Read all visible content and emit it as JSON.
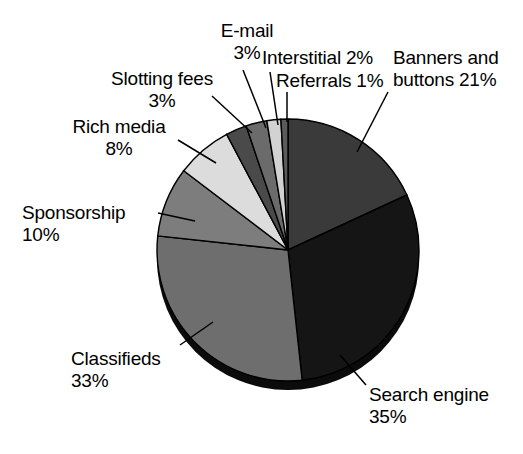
{
  "chart_data": {
    "type": "pie",
    "title": "",
    "subtitle": "",
    "xlabel": "",
    "ylabel": "",
    "legend_position": "callout-labels",
    "grid": false,
    "style": "3d-pie-grayscale",
    "value_unit": "%",
    "categories": [
      "Banners and buttons",
      "Search engine",
      "Classifieds",
      "Sponsorship",
      "Rich media",
      "Slotting fees",
      "E-mail",
      "Interstitial",
      "Referrals"
    ],
    "values": [
      21,
      35,
      33,
      10,
      8,
      3,
      3,
      2,
      1
    ],
    "colors": [
      "#3a3a3a",
      "#151515",
      "#6e6e6e",
      "#7d7d7d",
      "#dcdcdc",
      "#4a4a4a",
      "#6b6b6b",
      "#d2d2d2",
      "#5a5a5a"
    ],
    "slices": [
      {
        "label": "Banners and buttons",
        "value": 21,
        "text": "Banners and\nbuttons 21%",
        "color": "#3a3a3a"
      },
      {
        "label": "Search engine",
        "value": 35,
        "text": "Search engine\n35%",
        "color": "#151515"
      },
      {
        "label": "Classifieds",
        "value": 33,
        "text": "Classifieds\n33%",
        "color": "#6e6e6e"
      },
      {
        "label": "Sponsorship",
        "value": 10,
        "text": "Sponsorship\n10%",
        "color": "#7d7d7d"
      },
      {
        "label": "Rich media",
        "value": 8,
        "text": "Rich media\n8%",
        "color": "#dcdcdc"
      },
      {
        "label": "Slotting fees",
        "value": 3,
        "text": "Slotting fees\n3%",
        "color": "#4a4a4a"
      },
      {
        "label": "E-mail",
        "value": 3,
        "text": "E-mail\n3%",
        "color": "#6b6b6b"
      },
      {
        "label": "Interstitial",
        "value": 2,
        "text": "Interstitial 2%",
        "color": "#d2d2d2"
      },
      {
        "label": "Referrals",
        "value": 1,
        "text": "Referrals 1%",
        "color": "#5a5a5a"
      }
    ]
  },
  "labels": {
    "email": "E-mail\n3%",
    "slotting_fees": "Slotting fees\n3%",
    "rich_media": "Rich media\n8%",
    "sponsorship": "Sponsorship\n10%",
    "classifieds": "Classifieds\n33%",
    "interstitial": "Interstitial 2%",
    "referrals": "Referrals 1%",
    "banners_buttons": "Banners and\nbuttons 21%",
    "search_engine": "Search engine\n35%"
  },
  "geometry": {
    "center_x": 288,
    "center_y": 250,
    "radius": 131,
    "depth": 9,
    "start_angle_deg": -90
  }
}
